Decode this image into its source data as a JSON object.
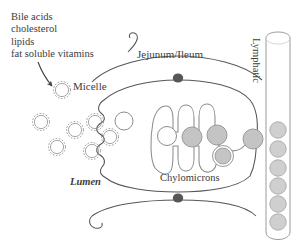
{
  "figure": {
    "type": "biological-diagram",
    "background_color": "#ffffff",
    "line_color": "#55565a",
    "text_color": "#3c3c3c",
    "chylomicron_fill": "#c4c4c4",
    "junction_color": "#555555"
  },
  "labels": {
    "substrates": {
      "line1": "Bile acids",
      "line2": "cholesterol",
      "line3": "lipids",
      "line4": "fat soluble vitamins"
    },
    "micelle": "Micelle",
    "jejunum_ileum": "Jejunum/Ileum",
    "lumen": "Lumen",
    "chylomicrons": "Chylomicrons",
    "lymphatic": "Lymphatic"
  },
  "micelles": {
    "count": 7,
    "style": "spiky-dashed-circle",
    "positions": [
      {
        "cx": 62,
        "cy": 90,
        "r": 9
      },
      {
        "cx": 41,
        "cy": 122,
        "r": 9
      },
      {
        "cx": 75,
        "cy": 130,
        "r": 9
      },
      {
        "cx": 57,
        "cy": 147,
        "r": 9
      },
      {
        "cx": 110,
        "cy": 137,
        "r": 9
      },
      {
        "cx": 60,
        "cy": 118,
        "r": 9
      },
      {
        "cx": 114,
        "cy": 112,
        "r": 9
      }
    ]
  },
  "chylomicrons": {
    "count": 6,
    "inside_cell": [
      {
        "cx": 167,
        "cy": 136,
        "r": 9,
        "filled": false
      },
      {
        "cx": 192,
        "cy": 137,
        "r": 10,
        "filled": true
      },
      {
        "cx": 216,
        "cy": 135,
        "r": 10,
        "filled": true
      },
      {
        "cx": 222,
        "cy": 155,
        "r": 10,
        "filled": true,
        "ringed": true
      },
      {
        "cx": 241,
        "cy": 139,
        "r": 10,
        "filled": true
      },
      {
        "cx": 136,
        "cy": 120,
        "r": 9,
        "filled": false
      }
    ]
  },
  "lymphatic_vessel": {
    "orientation": "vertical",
    "particle_count": 6,
    "particle_fill": "#cfcfcf",
    "particles_y": [
      130,
      149,
      168,
      186,
      204,
      222
    ]
  },
  "tight_junctions": {
    "count": 2,
    "positions": [
      {
        "cx": 178,
        "cy": 78
      },
      {
        "cx": 178,
        "cy": 198
      }
    ]
  }
}
